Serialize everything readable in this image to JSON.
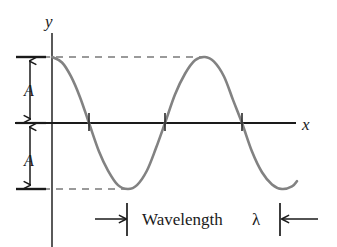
{
  "figure": {
    "kind": "wave-diagram",
    "background_color": "#ffffff",
    "width": 337,
    "height": 247
  },
  "axes": {
    "y_label": "y",
    "x_label": "x",
    "axis_color": "#1a1a1a",
    "y_axis_x": 52,
    "x_axis_y": 123,
    "x_axis_start": 15,
    "x_axis_end": 296
  },
  "amplitude": {
    "upper_label": "A",
    "lower_label": "A",
    "value_px": 66,
    "arrow_x": 30,
    "tick_color": "#1a1a1a"
  },
  "wavelength": {
    "caption": "Wavelength",
    "symbol": "λ",
    "left_marker_x": 127,
    "right_marker_x": 280,
    "baseline_y": 218
  },
  "guides": {
    "dash_color": "#777777",
    "top_dash_y": 57,
    "bottom_dash_y": 189,
    "dash_pattern": "7 6"
  },
  "chart_data": {
    "type": "line",
    "title": "",
    "xlabel": "x",
    "ylabel": "y",
    "curve_color": "#828282",
    "curve_width": 2.6,
    "waveform": "cosine",
    "amplitude": 1,
    "wavelength_px": 153,
    "phase": "starts at positive crest on the y-axis",
    "x_start_px": 52,
    "x_end_px": 297,
    "y_zero_px": 123,
    "y_crest_px": 57,
    "y_trough_px": 189,
    "annotations": [
      "A",
      "A",
      "Wavelength λ"
    ],
    "zero_crossings_px": [
      89,
      165,
      242
    ],
    "crests_px": [
      52,
      205
    ],
    "troughs_px": [
      128
    ],
    "grid": false,
    "legend": "none",
    "points": [
      {
        "x": 52,
        "y": 1.0
      },
      {
        "x": 62,
        "y": 0.917
      },
      {
        "x": 71,
        "y": 0.705
      },
      {
        "x": 80,
        "y": 0.391
      },
      {
        "x": 89,
        "y": 0.0
      },
      {
        "x": 99,
        "y": -0.432
      },
      {
        "x": 108,
        "y": -0.72
      },
      {
        "x": 118,
        "y": -0.941
      },
      {
        "x": 128,
        "y": -1.0
      },
      {
        "x": 137,
        "y": -0.941
      },
      {
        "x": 147,
        "y": -0.72
      },
      {
        "x": 156,
        "y": -0.38
      },
      {
        "x": 165,
        "y": 0.0
      },
      {
        "x": 175,
        "y": 0.432
      },
      {
        "x": 185,
        "y": 0.746
      },
      {
        "x": 195,
        "y": 0.95
      },
      {
        "x": 205,
        "y": 1.0
      },
      {
        "x": 214,
        "y": 0.93
      },
      {
        "x": 224,
        "y": 0.705
      },
      {
        "x": 233,
        "y": 0.35
      },
      {
        "x": 242,
        "y": 0.0
      },
      {
        "x": 252,
        "y": -0.432
      },
      {
        "x": 262,
        "y": -0.746
      },
      {
        "x": 272,
        "y": -0.93
      },
      {
        "x": 282,
        "y": -1.0
      },
      {
        "x": 292,
        "y": -0.96
      },
      {
        "x": 297,
        "y": -0.88
      }
    ]
  }
}
